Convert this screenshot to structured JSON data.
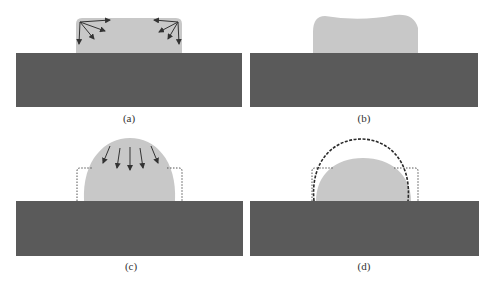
{
  "figure": {
    "colors": {
      "substrate": "#5a5a5a",
      "material": "#c8c8c8",
      "arrow": "#333333",
      "outline_dotted": "#555555",
      "outline_dashed": "#2a2a2a",
      "background": "#ffffff"
    },
    "panels": [
      {
        "id": "a",
        "label": "(a)",
        "content": "Rectangular block with rounded corners; arrows radiating from top corners (surface tension forces)"
      },
      {
        "id": "b",
        "label": "(b)",
        "content": "Block with concave top and rounded shoulders (intermediate deformation)"
      },
      {
        "id": "c",
        "label": "(c)",
        "content": "Tall dome shape with downward arrows; dotted outline of original block"
      },
      {
        "id": "d",
        "label": "(d)",
        "content": "Final low dome shape; dashed outline of previous dome and dotted outline of original block"
      }
    ]
  }
}
